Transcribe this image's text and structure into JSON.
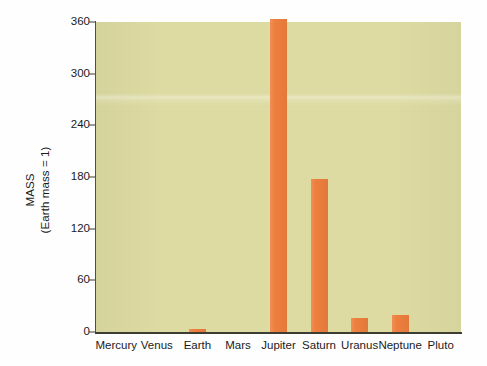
{
  "chart_data": {
    "type": "bar",
    "title": "",
    "subtitle": "",
    "xlabel": "",
    "ylabel_line1": "MASS",
    "ylabel_line2": "(Earth mass = 1)",
    "categories": [
      "Mercury",
      "Venus",
      "Earth",
      "Mars",
      "Jupiter",
      "Saturn",
      "Uranus",
      "Neptune",
      "Pluto"
    ],
    "values": [
      0.06,
      0.8,
      1,
      0.1,
      318,
      95,
      14.5,
      17,
      0.002
    ],
    "bar_pixel_values": [
      0,
      0,
      3,
      0,
      313,
      153,
      14,
      17,
      0
    ],
    "ylim": [
      0,
      360
    ],
    "yticks": [
      0,
      60,
      120,
      180,
      240,
      300,
      360
    ],
    "ytick_labels": [
      "0",
      "60",
      "120",
      "180",
      "240",
      "300",
      "360"
    ],
    "grid": false,
    "legend": null,
    "legend_position": "none",
    "colors": {
      "bar": "#ef7f3d",
      "plot_background": "#dedca2",
      "axis": "#3d3d33",
      "text": "#1b1b1b",
      "page_background": "#fefefe"
    }
  }
}
